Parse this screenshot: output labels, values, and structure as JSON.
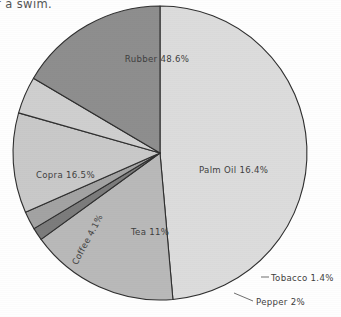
{
  "page": {
    "caption_fragment": "r a swim.",
    "background": "#fefefe"
  },
  "chart_data": {
    "type": "pie",
    "title": "",
    "subtitle": "",
    "xlabel": "",
    "ylabel": "",
    "grid": false,
    "legend_position": "none",
    "labels_inline": true,
    "start_angle_deg": 0,
    "direction": "clockwise",
    "center": {
      "x": 160,
      "y": 153
    },
    "radius": 147,
    "categories": [
      "Rubber",
      "Palm Oil",
      "Tobacco",
      "Pepper",
      "Tea",
      "Coffee",
      "Copra"
    ],
    "values": [
      48.6,
      16.4,
      1.4,
      2.0,
      11.0,
      4.1,
      16.5
    ],
    "units": "%",
    "slices": [
      {
        "name": "Rubber",
        "value": 48.6,
        "label": "Rubber 48.6%",
        "color": "#dcdcdc",
        "label_x": 157,
        "label_y": 62,
        "label_anchor": "middle",
        "label_rotation": 0,
        "callout": false
      },
      {
        "name": "Palm Oil",
        "value": 16.4,
        "label": "Palm Oil 16.4%",
        "color": "#b9b9b9",
        "label_x": 199,
        "label_y": 173,
        "label_anchor": "start",
        "label_rotation": 0,
        "callout": false
      },
      {
        "name": "Tobacco",
        "value": 1.4,
        "label": "Tobacco 1.4%",
        "color": "#7c7c7c",
        "label_x": 271,
        "label_y": 281,
        "label_anchor": "start",
        "label_rotation": 0,
        "callout": true,
        "leader": "M 261 277 L 269 277"
      },
      {
        "name": "Pepper",
        "value": 2.0,
        "label": "Pepper 2%",
        "color": "#a3a3a3",
        "label_x": 256,
        "label_y": 305,
        "label_anchor": "start",
        "label_rotation": 0,
        "callout": true,
        "leader": "M 234 293 L 253 301"
      },
      {
        "name": "Tea",
        "value": 11.0,
        "label": "Tea 11%",
        "color": "#c9c9c9",
        "label_x": 131,
        "label_y": 235,
        "label_anchor": "start",
        "label_rotation": 0,
        "callout": false
      },
      {
        "name": "Coffee",
        "value": 4.1,
        "label": "Coffee 4.1%",
        "color": "#cfcfcf",
        "label_x": 90,
        "label_y": 241,
        "label_anchor": "middle",
        "label_rotation": -62,
        "callout": false
      },
      {
        "name": "Copra",
        "value": 16.5,
        "label": "Copra 16.5%",
        "color": "#8e8e8e",
        "label_x": 36,
        "label_y": 178,
        "label_anchor": "start",
        "label_rotation": 0,
        "callout": false
      }
    ],
    "outline_color": "#2f2f2f",
    "outline_width": 1.1
  }
}
